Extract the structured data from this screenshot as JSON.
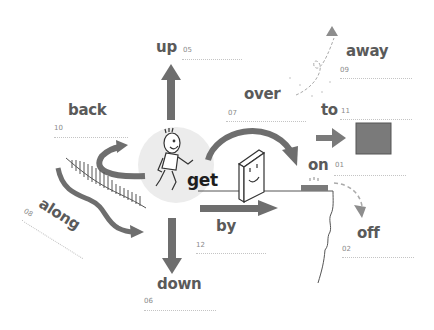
{
  "center": {
    "verb": "get",
    "figure": "running-boy"
  },
  "colors": {
    "arrow": "#6e6e6e",
    "arrow_light": "#8d8d8d",
    "text": "#5a5a5a",
    "center_text": "#1e1e1e",
    "circle": "#ececec",
    "box": "#7a7a7a",
    "rule": "#c4c4c4"
  },
  "particles": [
    {
      "word": "up",
      "number": "05"
    },
    {
      "word": "back",
      "number": "10"
    },
    {
      "word": "over",
      "number": "07"
    },
    {
      "word": "away",
      "number": "09"
    },
    {
      "word": "to",
      "number": "11"
    },
    {
      "word": "on",
      "number": "01"
    },
    {
      "word": "along",
      "number": "08"
    },
    {
      "word": "by",
      "number": "12"
    },
    {
      "word": "off",
      "number": "02"
    },
    {
      "word": "down",
      "number": "06"
    }
  ]
}
